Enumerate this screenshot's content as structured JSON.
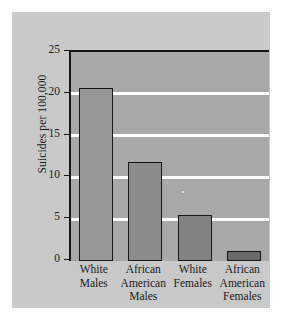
{
  "chart_data": {
    "type": "bar",
    "title": "",
    "xlabel": "",
    "ylabel": "Suicides per 100,000",
    "categories": [
      "White Males",
      "African American Males",
      "White Females",
      "African American Females"
    ],
    "category_lines": [
      [
        "White",
        "Males"
      ],
      [
        "African",
        "American",
        "Males"
      ],
      [
        "White",
        "Females"
      ],
      [
        "African",
        "American",
        "Females"
      ]
    ],
    "values": [
      20.7,
      11.8,
      5.5,
      1.2
    ],
    "ylim": [
      0,
      25
    ],
    "yticks": [
      0,
      5,
      10,
      15,
      20,
      25
    ],
    "ytick_labels": [
      "0",
      "5",
      "10",
      "15",
      "20",
      "25"
    ],
    "grid": "horizontal-white",
    "legend": "none",
    "bar_colors": [
      "#969696",
      "#8c8c8c",
      "#828282",
      "#6a6a6a"
    ],
    "bar_edge_color": "#171717",
    "plot_background": "#a8a8a8",
    "panel_background": "#c9c9c9",
    "figure_background": "#ffffff",
    "gridline_color": "#ffffff",
    "axis_color": "#171717",
    "text_color": "#1a1a1a"
  }
}
